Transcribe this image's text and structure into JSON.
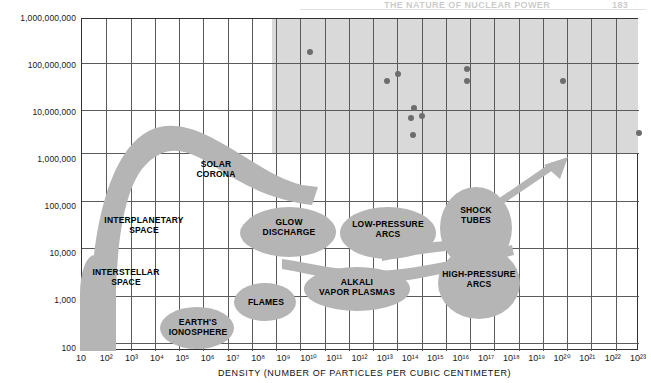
{
  "header": {
    "title": "THE NATURE OF NUCLEAR POWER",
    "page_number": "183"
  },
  "axes": {
    "y_title": "TEMPERATURE (DEGREES CELSIUS)",
    "x_title": "DENSITY (NUMBER OF PARTICLES PER CUBIC CENTIMETER)",
    "y_ticks": [
      "1,000,000,000",
      "100,000,000",
      "10,000,000",
      "1,000,000",
      "100,000",
      "10,000",
      "1,000",
      "100"
    ],
    "x_ticks": [
      "10",
      "10²",
      "10³",
      "10⁴",
      "10⁵",
      "10⁶",
      "10⁷",
      "10⁸",
      "10⁹",
      "10¹⁰",
      "10¹¹",
      "10¹²",
      "10¹³",
      "10¹⁴",
      "10¹⁵",
      "10¹⁶",
      "10¹⁷",
      "10¹⁸",
      "10¹⁹",
      "10²⁰",
      "10²¹",
      "10²²",
      "10²³"
    ]
  },
  "regions": [
    {
      "name": "interstellar-space",
      "label": "INTERSTELLAR\nSPACE"
    },
    {
      "name": "interplanetary-space",
      "label": "INTERPLANETARY\nSPACE"
    },
    {
      "name": "solar-corona",
      "label": "SOLAR\nCORONA"
    },
    {
      "name": "earths-ionosphere",
      "label": "EARTH'S\nIONOSPHERE"
    },
    {
      "name": "flames",
      "label": "FLAMES"
    },
    {
      "name": "glow-discharge",
      "label": "GLOW\nDISCHARGE"
    },
    {
      "name": "low-pressure-arcs",
      "label": "LOW-PRESSURE\nARCS"
    },
    {
      "name": "alkali-vapor-plasmas",
      "label": "ALKALI\nVAPOR PLASMAS"
    },
    {
      "name": "shock-tubes",
      "label": "SHOCK\nTUBES"
    },
    {
      "name": "high-pressure-arcs",
      "label": "HIGH-PRESSURE\nARCS"
    }
  ],
  "chart_data": {
    "type": "scatter",
    "title": "",
    "xlabel": "DENSITY (NUMBER OF PARTICLES PER CUBIC CENTIMETER)",
    "ylabel": "TEMPERATURE (DEGREES CELSIUS)",
    "xscale": "log",
    "yscale": "log",
    "xlim": [
      10,
      1e+23
    ],
    "ylim": [
      100,
      1000000000
    ],
    "grid": true,
    "legend": "none",
    "shaded_region": {
      "label": "fusion-regime-shading",
      "x_range": [
        100000000.0,
        1e+23
      ],
      "y_range": [
        1000000,
        1000000000
      ],
      "color": "#d9d9d9"
    },
    "points": [
      {
        "x": 10000000000.0,
        "y": 200000000.0
      },
      {
        "x": 11000000000000.0,
        "y": 50000000.0
      },
      {
        "x": 30000000000000.0,
        "y": 70000000.0
      },
      {
        "x": 130000000000000.0,
        "y": 13000000.0
      },
      {
        "x": 100000000000000.0,
        "y": 8000000.0
      },
      {
        "x": 260000000000000.0,
        "y": 9000000.0
      },
      {
        "x": 120000000000000.0,
        "y": 3500000.0
      },
      {
        "x": 1.6e+16,
        "y": 90000000.0
      },
      {
        "x": 1.6e+16,
        "y": 50000000.0
      },
      {
        "x": 1e+20,
        "y": 50000000.0
      },
      {
        "x": 1e+23,
        "y": 4000000.0
      }
    ],
    "series": [
      {
        "name": "experimental plasma devices",
        "marker": "circle",
        "color": "#6d6d6d"
      }
    ],
    "annotations": [
      {
        "type": "arrow",
        "name": "trend-arrow",
        "from": [
          1e+17,
          20000.0
        ],
        "to": [
          3e+19,
          1300000.0
        ]
      }
    ]
  },
  "colors": {
    "blob_fill": "#b5b5b5",
    "shade_fill": "#d9d9d9",
    "grid": "#5a5a5a",
    "point": "#6d6d6d",
    "frame": "#333333"
  }
}
